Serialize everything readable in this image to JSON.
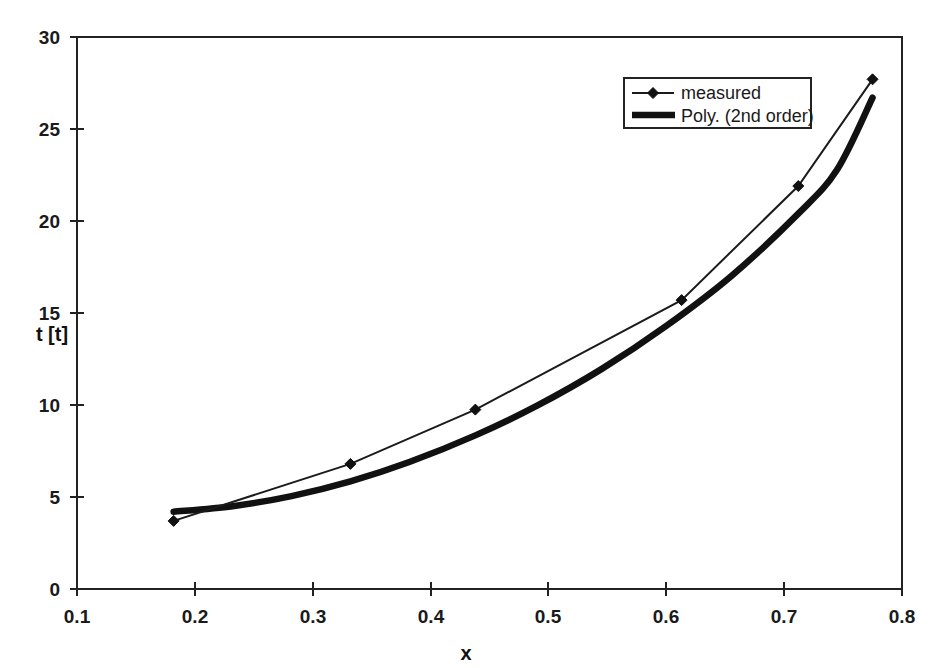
{
  "chart_data": {
    "type": "line",
    "title": "",
    "xlabel": "x",
    "ylabel": "t [t]",
    "xlim": [
      0.1,
      0.8
    ],
    "ylim": [
      0,
      30
    ],
    "xticks": [
      "0.1",
      "0.2",
      "0.3",
      "0.4",
      "0.5",
      "0.6",
      "0.7",
      "0.8"
    ],
    "xtick_values": [
      0.1,
      0.2,
      0.3,
      0.4,
      0.5,
      0.6,
      0.7,
      0.8
    ],
    "yticks": [
      "0",
      "5",
      "10",
      "15",
      "20",
      "25",
      "30"
    ],
    "ytick_values": [
      0,
      5,
      10,
      15,
      20,
      25,
      30
    ],
    "grid": false,
    "legend_position": "upper right inside plot area",
    "series": [
      {
        "name": "measured",
        "style": "thin line with diamond markers",
        "color": "#1b1b1b",
        "x": [
          0.182,
          0.332,
          0.438,
          0.613,
          0.712,
          0.775
        ],
        "values": [
          3.7,
          6.8,
          9.75,
          15.7,
          21.9,
          27.7
        ]
      },
      {
        "name": "Poly. (2nd order)",
        "style": "thick smooth line, no markers",
        "color": "#111111",
        "x": [
          0.182,
          0.232,
          0.282,
          0.332,
          0.382,
          0.438,
          0.49,
          0.545,
          0.6,
          0.655,
          0.712,
          0.745,
          0.775
        ],
        "values": [
          4.2,
          4.5,
          5.05,
          5.85,
          6.9,
          8.35,
          9.95,
          11.95,
          14.3,
          17.0,
          20.4,
          22.8,
          26.7
        ]
      }
    ],
    "legend_entries": [
      "measured",
      "Poly. (2nd order)"
    ]
  },
  "axes": {
    "x_axis_label": "x",
    "y_axis_label": "t [t]"
  },
  "legend": {
    "entry_measured": "measured",
    "entry_poly": "Poly. (2nd order)"
  },
  "x_tick_labels": [
    "0.1",
    "0.2",
    "0.3",
    "0.4",
    "0.5",
    "0.6",
    "0.7",
    "0.8"
  ],
  "y_tick_labels": [
    "30",
    "25",
    "20",
    "15",
    "10",
    "5",
    "0"
  ]
}
